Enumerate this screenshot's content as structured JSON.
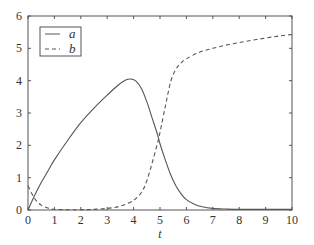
{
  "chart_data": {
    "type": "line",
    "title": "",
    "xlabel": "t",
    "ylabel": "",
    "xlim": [
      0,
      10
    ],
    "ylim": [
      0,
      6
    ],
    "xticks": [
      0,
      1,
      2,
      3,
      4,
      5,
      6,
      7,
      8,
      9,
      10
    ],
    "yticks": [
      0,
      1,
      2,
      3,
      4,
      5,
      6
    ],
    "grid": false,
    "legend": {
      "position": "upper left",
      "entries": [
        "a",
        "b"
      ]
    },
    "series": [
      {
        "name": "a",
        "style": "solid",
        "x": [
          0,
          0.25,
          0.5,
          0.75,
          1.0,
          1.5,
          2.0,
          2.5,
          3.0,
          3.4,
          3.7,
          3.9,
          4.1,
          4.3,
          4.5,
          4.7,
          4.9,
          5.0,
          5.2,
          5.4,
          5.6,
          5.8,
          6.0,
          6.3,
          6.6,
          7.0,
          7.5,
          8.0,
          9.0,
          10.0
        ],
        "y": [
          0,
          0.45,
          0.85,
          1.2,
          1.55,
          2.15,
          2.7,
          3.15,
          3.55,
          3.85,
          4.02,
          4.05,
          3.98,
          3.75,
          3.35,
          2.85,
          2.35,
          2.05,
          1.55,
          1.1,
          0.75,
          0.5,
          0.32,
          0.18,
          0.1,
          0.05,
          0.03,
          0.02,
          0.02,
          0.02
        ]
      },
      {
        "name": "b",
        "style": "dashed",
        "x": [
          0,
          0.15,
          0.3,
          0.5,
          0.75,
          1.0,
          1.5,
          2.0,
          2.5,
          3.0,
          3.5,
          4.0,
          4.3,
          4.5,
          4.7,
          4.9,
          5.0,
          5.2,
          5.4,
          5.6,
          5.8,
          6.0,
          6.5,
          7.0,
          7.5,
          8.0,
          8.5,
          9.0,
          9.5,
          10.0
        ],
        "y": [
          0.75,
          0.5,
          0.3,
          0.15,
          0.06,
          0.02,
          0.01,
          0.01,
          0.02,
          0.05,
          0.12,
          0.3,
          0.55,
          0.9,
          1.45,
          2.05,
          2.4,
          3.2,
          3.95,
          4.35,
          4.55,
          4.68,
          4.88,
          5.0,
          5.1,
          5.18,
          5.25,
          5.32,
          5.38,
          5.43
        ]
      }
    ]
  },
  "axes": {
    "xlabel": "t",
    "xtick_labels": [
      "0",
      "1",
      "2",
      "3",
      "4",
      "5",
      "6",
      "7",
      "8",
      "9",
      "10"
    ],
    "ytick_labels": [
      "0",
      "1",
      "2",
      "3",
      "4",
      "5",
      "6"
    ]
  },
  "legend": {
    "items": [
      {
        "label": "a",
        "style": "solid"
      },
      {
        "label": "b",
        "style": "dashed"
      }
    ]
  },
  "colors": {
    "line": "#555555",
    "axis": "#555555",
    "text": "#333333"
  }
}
